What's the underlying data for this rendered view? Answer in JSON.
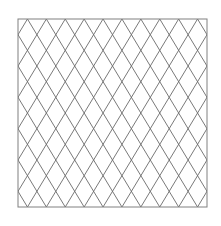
{
  "diagram": {
    "type": "diamond-lattice",
    "box": {
      "x": 18,
      "y": 19,
      "width": 189,
      "height": 188
    },
    "columns": 10,
    "rows": 6,
    "colors": {
      "background": "#ffffff",
      "line": "#6a6a6a",
      "border": "#808080"
    },
    "line_width": 0.9,
    "border_width": 1
  }
}
